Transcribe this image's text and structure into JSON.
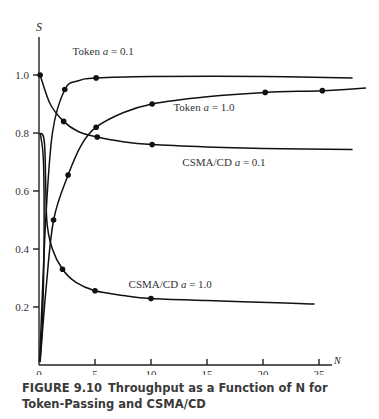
{
  "chart_data": {
    "type": "line",
    "title": "",
    "caption": {
      "figure_number": "FIGURE 9.10",
      "text": "Throughput as a Function of N for Token-Passing and CSMA/CD"
    },
    "xlabel": "N",
    "ylabel": "S",
    "xlim": [
      0,
      26
    ],
    "ylim": [
      0,
      1.1
    ],
    "x_ticks": [
      0,
      5,
      10,
      15,
      20,
      25
    ],
    "x_tick_labels": [
      "0",
      "5",
      "10",
      "15",
      "20",
      "25"
    ],
    "y_ticks": [
      0.2,
      0.4,
      0.6,
      0.8,
      1.0
    ],
    "y_tick_labels": [
      "0.2",
      "0.4",
      "0.6",
      "0.8",
      "1.0"
    ],
    "grid": false,
    "legend": "inline labels",
    "series": [
      {
        "name": "Token a = 0.1",
        "label": "Token a = 0.1",
        "label_pos": [
          3.0,
          1.07
        ],
        "markers": [
          [
            2.3,
            0.95
          ],
          [
            5.1,
            0.99
          ]
        ],
        "curve": [
          [
            0.05,
            0.01
          ],
          [
            0.6,
            0.5
          ],
          [
            1.2,
            0.8
          ],
          [
            2.3,
            0.95
          ],
          [
            3.5,
            0.98
          ],
          [
            5.1,
            0.99
          ],
          [
            10,
            0.995
          ],
          [
            20,
            0.995
          ],
          [
            28,
            0.99
          ]
        ]
      },
      {
        "name": "Token a = 1.0",
        "label": "Token a = 1.0",
        "label_pos": [
          12.0,
          0.875
        ],
        "markers": [
          [
            1.3,
            0.5
          ],
          [
            2.6,
            0.655
          ],
          [
            5.1,
            0.82
          ],
          [
            10.1,
            0.9
          ],
          [
            20.2,
            0.94
          ],
          [
            25.3,
            0.946
          ]
        ],
        "curve": [
          [
            0.1,
            0.01
          ],
          [
            0.6,
            0.25
          ],
          [
            1.3,
            0.5
          ],
          [
            2.6,
            0.655
          ],
          [
            3.8,
            0.76
          ],
          [
            5.1,
            0.82
          ],
          [
            7.5,
            0.87
          ],
          [
            10.1,
            0.9
          ],
          [
            15,
            0.925
          ],
          [
            20.2,
            0.94
          ],
          [
            25.3,
            0.946
          ],
          [
            29.2,
            0.955
          ]
        ]
      },
      {
        "name": "CSMA/CD a = 0.1",
        "label": "CSMA/CD a = 0.1",
        "label_pos": [
          12.8,
          0.685
        ],
        "markers": [
          [
            0.1,
            1.0
          ],
          [
            2.2,
            0.84
          ],
          [
            5.2,
            0.786
          ],
          [
            10.1,
            0.76
          ]
        ],
        "curve": [
          [
            0.1,
            1.0
          ],
          [
            1.0,
            0.9
          ],
          [
            2.2,
            0.84
          ],
          [
            3.5,
            0.805
          ],
          [
            5.2,
            0.786
          ],
          [
            7.5,
            0.77
          ],
          [
            10.1,
            0.76
          ],
          [
            15,
            0.752
          ],
          [
            20,
            0.747
          ],
          [
            28,
            0.743
          ]
        ]
      },
      {
        "name": "CSMA/CD a = 1.0",
        "label": "CSMA/CD a = 1.0",
        "label_pos": [
          8.0,
          0.265
        ],
        "markers": [
          [
            2.1,
            0.33
          ],
          [
            5.0,
            0.256
          ],
          [
            10.0,
            0.229
          ]
        ],
        "curve": [
          [
            0.1,
            0.8
          ],
          [
            0.5,
            0.76
          ],
          [
            0.7,
            0.5
          ],
          [
            1.2,
            0.4
          ],
          [
            2.1,
            0.33
          ],
          [
            3.3,
            0.285
          ],
          [
            5.0,
            0.256
          ],
          [
            7.5,
            0.24
          ],
          [
            10.0,
            0.229
          ],
          [
            15,
            0.222
          ],
          [
            22,
            0.214
          ],
          [
            24.6,
            0.21
          ]
        ]
      },
      {
        "name": "CSMA/CD a = 1.0 (low-N branch)",
        "label": "",
        "markers": [],
        "curve": [
          [
            0.1,
            0.8
          ],
          [
            0.4,
            0.7
          ],
          [
            0.45,
            0.4
          ],
          [
            0.3,
            0.15
          ],
          [
            0.1,
            0.02
          ]
        ]
      }
    ]
  }
}
